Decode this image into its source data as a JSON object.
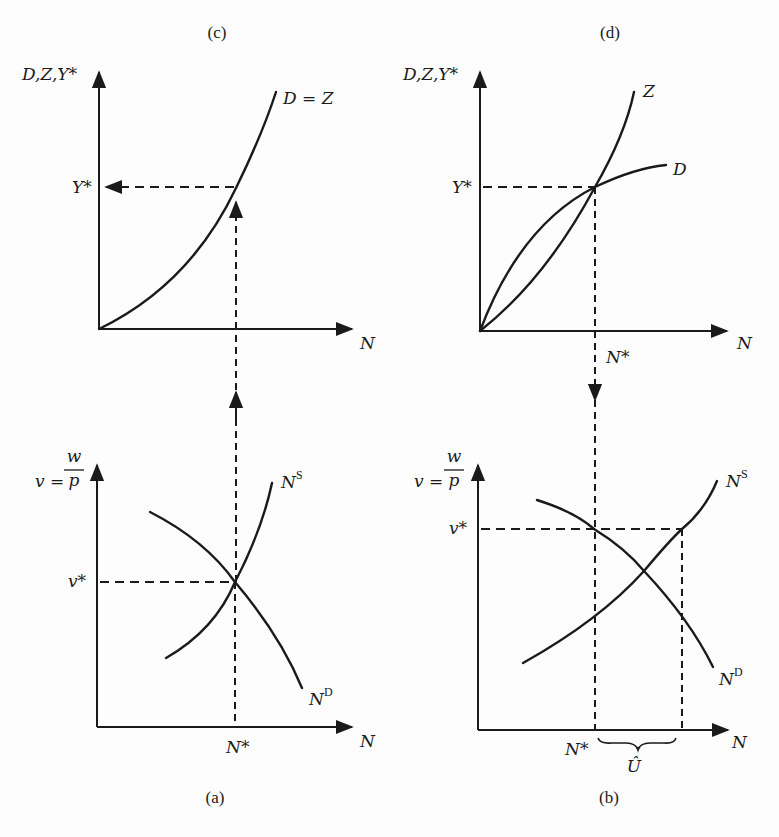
{
  "figure": {
    "panels": {
      "c": {
        "caption": "(c)",
        "y_axis_label": "D,Z,Y*",
        "x_axis_label": "N",
        "curve_label": "D = Z",
        "y_marker": "Y*"
      },
      "d": {
        "caption": "(d)",
        "y_axis_label": "D,Z,Y*",
        "x_axis_label": "N",
        "curve_labels": [
          "Z",
          "D"
        ],
        "y_marker": "Y*",
        "x_marker": "N*"
      },
      "a": {
        "caption": "(a)",
        "y_axis_label_lhs": "v =",
        "y_axis_label_num": "w",
        "y_axis_label_den": "p",
        "x_axis_label": "N",
        "supply_label": "N",
        "supply_sup": "S",
        "demand_label": "N",
        "demand_sup": "D",
        "y_marker": "v*",
        "x_marker": "N*"
      },
      "b": {
        "caption": "(b)",
        "y_axis_label_lhs": "v =",
        "y_axis_label_num": "w",
        "y_axis_label_den": "p",
        "x_axis_label": "N",
        "supply_label": "N",
        "supply_sup": "S",
        "demand_label": "N",
        "demand_sup": "D",
        "y_marker": "v*",
        "x_marker": "N*",
        "gap_label": "Û"
      }
    }
  }
}
